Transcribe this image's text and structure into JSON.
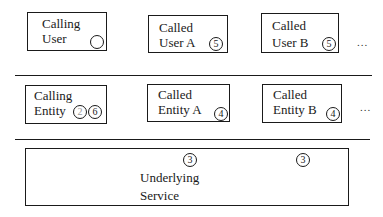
{
  "diagram": {
    "rows": [
      {
        "name": "user-layer",
        "boxes": [
          {
            "line1": "Calling",
            "line2": "User",
            "markers": [
              "1"
            ]
          },
          {
            "line1": "Called",
            "line2": "User A",
            "markers": [
              "5"
            ]
          },
          {
            "line1": "Called",
            "line2": "User B",
            "markers": [
              "5"
            ]
          }
        ],
        "ellipsis": "..."
      },
      {
        "name": "entity-layer",
        "boxes": [
          {
            "line1": "Calling",
            "line2": "Entity",
            "markers": [
              "2",
              "6"
            ]
          },
          {
            "line1": "Called",
            "line2": "Entity A",
            "markers": [
              "4"
            ]
          },
          {
            "line1": "Called",
            "line2": "Entity B",
            "markers": [
              "4"
            ]
          }
        ],
        "ellipsis": "..."
      },
      {
        "name": "service-layer",
        "boxes": [
          {
            "line1": "Underlying",
            "line2": "Service",
            "markers": [
              "3",
              "3"
            ]
          }
        ]
      }
    ]
  }
}
